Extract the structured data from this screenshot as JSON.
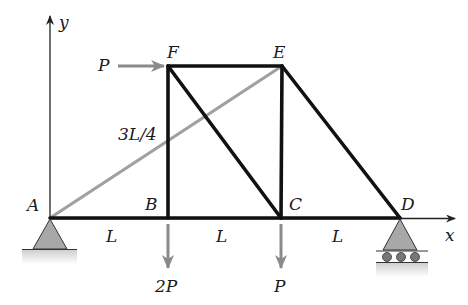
{
  "diagram": {
    "type": "truss",
    "axes": {
      "x_label": "x",
      "y_label": "y"
    },
    "nodes": [
      {
        "id": "A",
        "label": "A",
        "x": 50,
        "y": 218
      },
      {
        "id": "B",
        "label": "B",
        "x": 168,
        "y": 218
      },
      {
        "id": "C",
        "label": "C",
        "x": 281,
        "y": 218
      },
      {
        "id": "D",
        "label": "D",
        "x": 400,
        "y": 218
      },
      {
        "id": "E",
        "label": "E",
        "x": 282,
        "y": 66
      },
      {
        "id": "F",
        "label": "F",
        "x": 168,
        "y": 66
      }
    ],
    "members": [
      {
        "from": "A",
        "to": "B",
        "style": "black"
      },
      {
        "from": "B",
        "to": "C",
        "style": "black"
      },
      {
        "from": "C",
        "to": "D",
        "style": "black"
      },
      {
        "from": "F",
        "to": "E",
        "style": "black"
      },
      {
        "from": "B",
        "to": "F",
        "style": "black"
      },
      {
        "from": "C",
        "to": "E",
        "style": "black"
      },
      {
        "from": "F",
        "to": "C",
        "style": "black"
      },
      {
        "from": "E",
        "to": "D",
        "style": "black"
      },
      {
        "from": "A",
        "to": "E",
        "style": "gray"
      }
    ],
    "dimensions": {
      "span_AB": "L",
      "span_BC": "L",
      "span_CD": "L",
      "height": "3L/4"
    },
    "loads": [
      {
        "node": "F",
        "label": "P",
        "direction": "right"
      },
      {
        "node": "B",
        "label": "2P",
        "direction": "down"
      },
      {
        "node": "C",
        "label": "P",
        "direction": "down"
      }
    ],
    "supports": [
      {
        "node": "A",
        "type": "pin"
      },
      {
        "node": "D",
        "type": "roller"
      }
    ],
    "colors": {
      "member": "#111111",
      "highlight_member": "#a0a0a0",
      "load_arrow": "#8a8a8a",
      "support": "#a8a8a8"
    }
  }
}
